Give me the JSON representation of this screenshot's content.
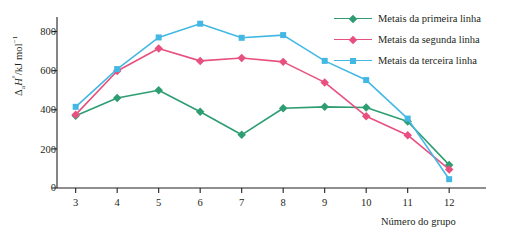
{
  "chart_data": {
    "type": "line",
    "title": "",
    "xlabel": "Número do grupo",
    "ylabel": "ΔaH°/kJ mol⁻¹",
    "ylabel_parts": {
      "delta": "Δ",
      "sub": "a",
      "italic": "H",
      "sup_deg": "°",
      "unit": "/kJ mol",
      "unit_sup": "−1"
    },
    "x": [
      3,
      4,
      5,
      6,
      7,
      8,
      9,
      10,
      11,
      12
    ],
    "categories": [
      "3",
      "4",
      "5",
      "6",
      "7",
      "8",
      "9",
      "10",
      "11",
      "12"
    ],
    "xlim": [
      2.55,
      12.55
    ],
    "ylim": [
      0,
      900
    ],
    "yticks": [
      0,
      200,
      400,
      600,
      800
    ],
    "ytick_labels": [
      "0",
      "200",
      "400",
      "600",
      "800"
    ],
    "grid": false,
    "legend_position": "top-right",
    "series": [
      {
        "name": "Metais da primeira linha",
        "color": "#2e9e72",
        "marker": "diamond",
        "values": [
          370,
          460,
          500,
          390,
          272,
          408,
          415,
          412,
          340,
          118
        ]
      },
      {
        "name": "Metais da segunda linha",
        "color": "#e8507f",
        "marker": "diamond",
        "values": [
          375,
          598,
          713,
          650,
          665,
          645,
          540,
          367,
          270,
          95
        ]
      },
      {
        "name": "Metais da terceira linha",
        "color": "#44b8e4",
        "marker": "square",
        "values": [
          415,
          608,
          770,
          840,
          768,
          782,
          650,
          552,
          355,
          45
        ]
      }
    ]
  },
  "axes": {
    "x_axis_label": "Número do grupo",
    "y_tick_labels": [
      "800",
      "600",
      "400",
      "200",
      "0"
    ]
  },
  "legend": {
    "items": [
      {
        "label": "Metais da primeira linha",
        "color": "#2e9e72",
        "marker": "diamond"
      },
      {
        "label": "Metais da segunda linha",
        "color": "#e8507f",
        "marker": "diamond"
      },
      {
        "label": "Metais da terceira linha",
        "color": "#44b8e4",
        "marker": "square"
      }
    ]
  },
  "colors": {
    "first_row": "#2e9e72",
    "second_row": "#e8507f",
    "third_row": "#44b8e4",
    "axis": "#231f20",
    "background": "#ffffff"
  }
}
